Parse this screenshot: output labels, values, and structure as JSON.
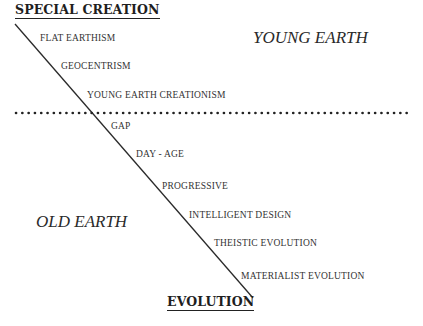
{
  "diagram": {
    "top_pole": "SPECIAL CREATION",
    "bottom_pole": "EVOLUTION",
    "regions": {
      "upper": "YOUNG EARTH",
      "lower": "OLD EARTH"
    },
    "positions": [
      {
        "label": "FLAT EARTHISM"
      },
      {
        "label": "GEOCENTRISM"
      },
      {
        "label": "YOUNG EARTH CREATIONISM"
      },
      {
        "label": "GAP"
      },
      {
        "label": "DAY - AGE"
      },
      {
        "label": "PROGRESSIVE"
      },
      {
        "label": "INTELLIGENT DESIGN"
      },
      {
        "label": "THEISTIC EVOLUTION"
      },
      {
        "label": "MATERIALIST EVOLUTION"
      }
    ],
    "colors": {
      "line": "#2a2a2a",
      "divider_dots": "#222222",
      "background": "#ffffff"
    }
  }
}
